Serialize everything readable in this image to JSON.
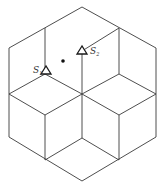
{
  "diagram": {
    "colors": {
      "line": "#3a3a3a",
      "marker": "#1a1a1a",
      "background": "#ffffff"
    },
    "markers": [
      {
        "id": "S1",
        "label": "S",
        "subscript": "1",
        "shape": "triangle",
        "x": 46,
        "y": 71
      },
      {
        "id": "S2",
        "label": "S",
        "subscript": "2",
        "shape": "triangle",
        "x": 82,
        "y": 51
      }
    ],
    "point": {
      "shape": "dot",
      "x": 63,
      "y": 61
    }
  }
}
